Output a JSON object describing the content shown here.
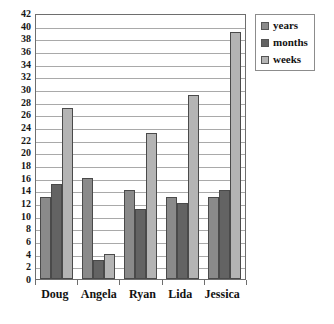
{
  "chart_data": {
    "type": "bar",
    "title": "",
    "subtitle": "",
    "xlabel": "",
    "ylabel": "",
    "categories": [
      "Doug",
      "Angela",
      "Ryan",
      "Lida",
      "Jessica"
    ],
    "series": [
      {
        "name": "years",
        "values": [
          13,
          16,
          14,
          13,
          13
        ],
        "color": "#8a8a8a"
      },
      {
        "name": "months",
        "values": [
          15,
          3,
          11,
          12,
          14
        ],
        "color": "#636363"
      },
      {
        "name": "weeks",
        "values": [
          27,
          4,
          23,
          29,
          39
        ],
        "color": "#b4b4b4"
      }
    ],
    "ylim": [
      0,
      42
    ],
    "ytick_step": 2,
    "yticks": [
      0,
      2,
      4,
      6,
      8,
      10,
      12,
      14,
      16,
      18,
      20,
      22,
      24,
      26,
      28,
      30,
      32,
      34,
      36,
      38,
      40,
      42
    ],
    "grid": true,
    "grid_axis": "y",
    "legend_position": "right-top",
    "legend_entries": [
      "years",
      "months",
      "weeks"
    ],
    "annotations": []
  }
}
